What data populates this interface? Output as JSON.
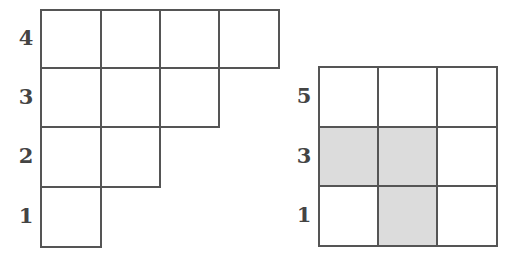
{
  "colors": {
    "line": "#555555",
    "shaded": "#dcdcdc",
    "label": "#444444"
  },
  "left_diagram": {
    "name": "staircase-young-diagram",
    "rows": [
      {
        "label": "4",
        "cells": 4
      },
      {
        "label": "3",
        "cells": 3
      },
      {
        "label": "2",
        "cells": 2
      },
      {
        "label": "1",
        "cells": 1
      }
    ]
  },
  "right_diagram": {
    "name": "3x3-grid",
    "rows": [
      {
        "label": "5",
        "shaded": [
          false,
          false,
          false
        ]
      },
      {
        "label": "3",
        "shaded": [
          true,
          true,
          false
        ]
      },
      {
        "label": "1",
        "shaded": [
          false,
          true,
          false
        ]
      }
    ]
  },
  "captions": {
    "left": "",
    "right": ""
  }
}
